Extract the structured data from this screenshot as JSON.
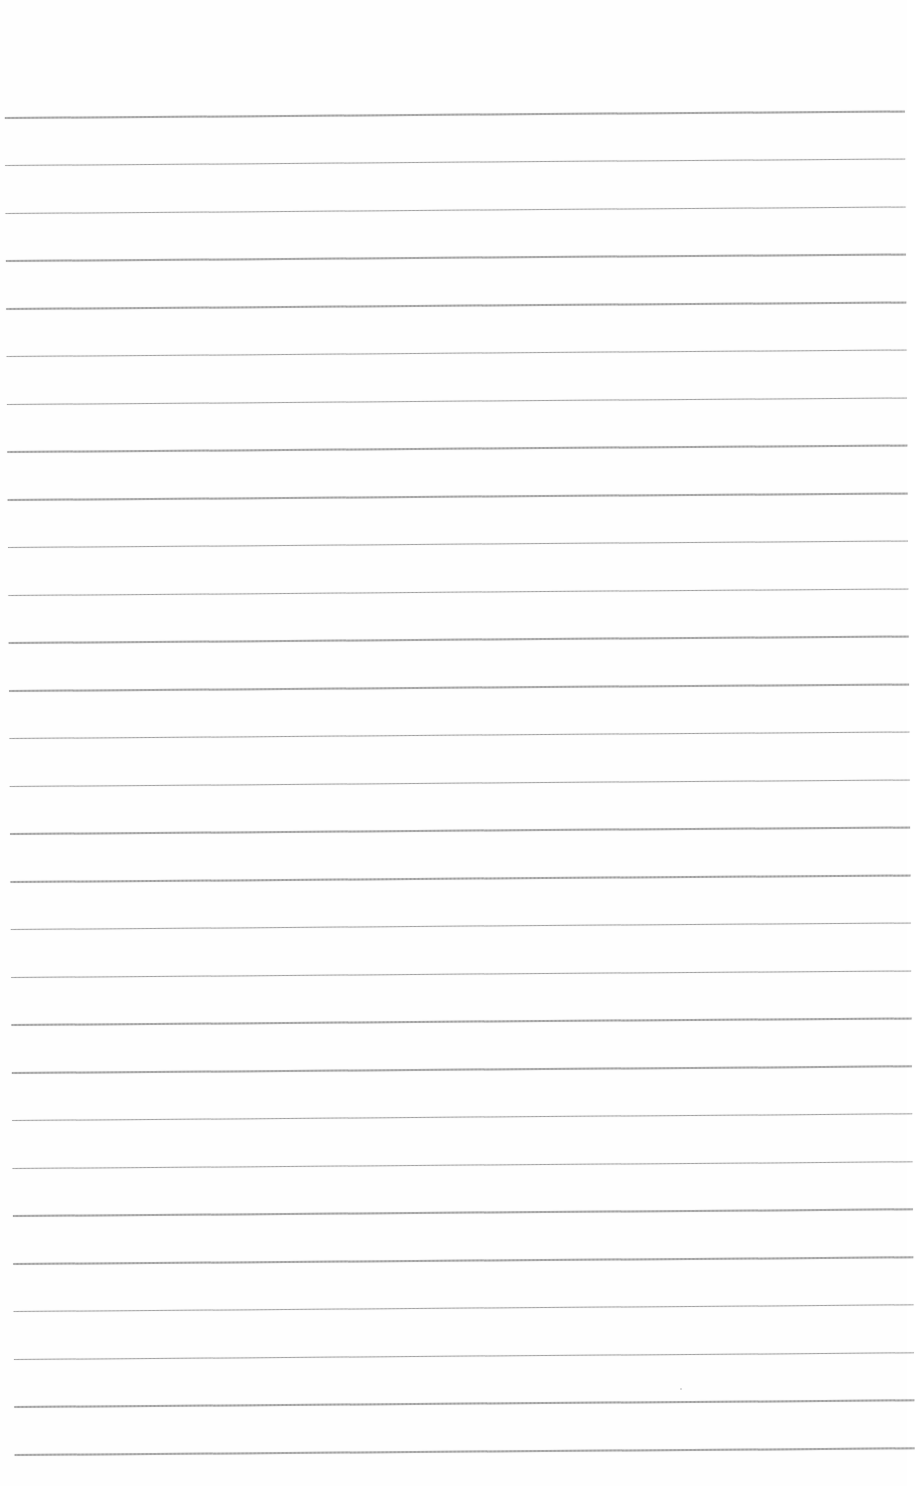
{
  "page": {
    "type": "lined-paper",
    "background_color": "#ffffff",
    "rule_color": "#a8a8a8",
    "rule_count": 29,
    "first_rule_y": 117,
    "rule_spacing_px": 47.75
  },
  "content": {
    "text": ""
  }
}
